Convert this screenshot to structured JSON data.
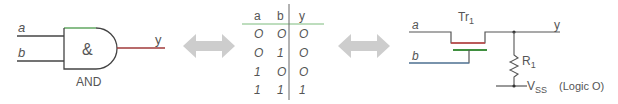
{
  "gate": {
    "input_a": "a",
    "input_b": "b",
    "output": "y",
    "symbol": "&",
    "name": "AND"
  },
  "truth_table": {
    "headers": [
      "a",
      "b",
      "y"
    ],
    "rows": [
      [
        "O",
        "O",
        "O"
      ],
      [
        "O",
        "1",
        "O"
      ],
      [
        "1",
        "O",
        "O"
      ],
      [
        "1",
        "1",
        "1"
      ]
    ]
  },
  "circuit": {
    "input_a": "a",
    "input_b": "b",
    "output": "y",
    "transistor": "Tr",
    "transistor_sub": "1",
    "resistor": "R",
    "resistor_sub": "1",
    "supply": "V",
    "supply_sub": "SS",
    "supply_note": "(Logic O)"
  },
  "colors": {
    "line": "#555555",
    "green": "#4caf50",
    "red": "#b03030",
    "blue": "#4a7fb0",
    "arrow": "#cfcfcf"
  }
}
